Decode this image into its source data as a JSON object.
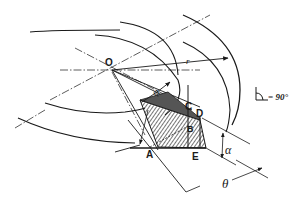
{
  "diagram": {
    "type": "technical-geometry-drawing",
    "labels": {
      "origin": "O",
      "point_a": "A",
      "point_b": "B",
      "point_c": "C",
      "point_d": "D",
      "point_e": "E",
      "radius": "r",
      "angle_phi": "φ",
      "angle_alpha": "α",
      "angle_theta": "θ"
    },
    "legend": {
      "right_angle_text": "= 90°"
    },
    "colors": {
      "ink": "#1a1a1a",
      "background": "#ffffff"
    }
  }
}
